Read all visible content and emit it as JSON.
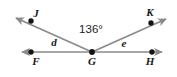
{
  "figure": {
    "kind": "geometry-angle-diagram",
    "background_color": "#ffffff",
    "line_color": "#8a8a8a",
    "point_color": "#141414",
    "text_color": "#171717",
    "width": 177,
    "height": 77
  },
  "labels": {
    "point_j": "J",
    "point_k": "K",
    "point_f": "F",
    "point_g": "G",
    "point_h": "H",
    "angle_d": "d",
    "angle_e": "e",
    "angle_measure": "136°"
  },
  "points": [
    {
      "name": "J",
      "x": 31,
      "y": 21
    },
    {
      "name": "K",
      "x": 151,
      "y": 23
    },
    {
      "name": "F",
      "x": 31,
      "y": 52
    },
    {
      "name": "G",
      "x": 92,
      "y": 52
    },
    {
      "name": "H",
      "x": 152,
      "y": 52
    }
  ],
  "rays": [
    {
      "name": "ray-GF",
      "from": "G",
      "through": "F",
      "arrow_tip": {
        "x": 17,
        "y": 52
      }
    },
    {
      "name": "ray-GH",
      "from": "G",
      "through": "H",
      "arrow_tip": {
        "x": 167,
        "y": 52
      }
    },
    {
      "name": "ray-GJ",
      "from": "G",
      "through": "J",
      "arrow_tip": {
        "x": 11,
        "y": 15
      }
    },
    {
      "name": "ray-GK",
      "from": "G",
      "through": "K",
      "arrow_tip": {
        "x": 171,
        "y": 16
      }
    }
  ],
  "angles": [
    {
      "name": "angle-FGJ",
      "label": "d",
      "vertex": "G",
      "label_x": 54,
      "label_y": 44
    },
    {
      "name": "angle-JGK",
      "label": "136°",
      "vertex": "G",
      "label_x": 90,
      "label_y": 32
    },
    {
      "name": "angle-KGH",
      "label": "e",
      "vertex": "G",
      "label_x": 124,
      "label_y": 46
    }
  ]
}
